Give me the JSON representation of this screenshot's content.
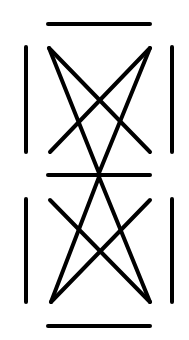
{
  "diagram": {
    "width": 189,
    "height": 340,
    "background": "#ffffff",
    "stroke_color": "#000000",
    "stroke_width": 4,
    "horizontal_bars": [
      {
        "x1": 48,
        "y1": 24,
        "x2": 150,
        "y2": 24
      },
      {
        "x1": 48,
        "y1": 175,
        "x2": 150,
        "y2": 175
      },
      {
        "x1": 48,
        "y1": 326,
        "x2": 150,
        "y2": 326
      }
    ],
    "vertical_bars": [
      {
        "x1": 26,
        "y1": 47,
        "x2": 26,
        "y2": 152
      },
      {
        "x1": 172,
        "y1": 47,
        "x2": 172,
        "y2": 152
      },
      {
        "x1": 26,
        "y1": 199,
        "x2": 26,
        "y2": 302
      },
      {
        "x1": 172,
        "y1": 199,
        "x2": 172,
        "y2": 302
      }
    ],
    "upper_figure_lines": [
      {
        "x1": 49,
        "y1": 48,
        "x2": 150,
        "y2": 152
      },
      {
        "x1": 150,
        "y1": 48,
        "x2": 50,
        "y2": 152
      },
      {
        "x1": 49,
        "y1": 48,
        "x2": 99,
        "y2": 173
      },
      {
        "x1": 150,
        "y1": 48,
        "x2": 99,
        "y2": 173
      }
    ],
    "lower_figure_lines": [
      {
        "x1": 50,
        "y1": 200,
        "x2": 150,
        "y2": 302
      },
      {
        "x1": 150,
        "y1": 200,
        "x2": 51,
        "y2": 302
      },
      {
        "x1": 99,
        "y1": 177,
        "x2": 51,
        "y2": 302
      },
      {
        "x1": 99,
        "y1": 177,
        "x2": 150,
        "y2": 302
      }
    ]
  }
}
